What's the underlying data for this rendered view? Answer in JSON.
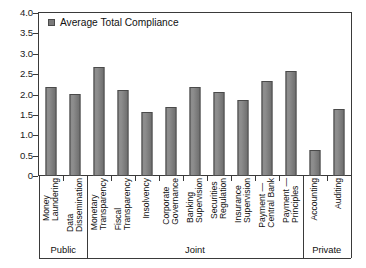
{
  "chart_data": {
    "type": "bar",
    "title": "",
    "xlabel": "",
    "ylabel": "",
    "ylim": [
      0,
      4.0
    ],
    "ytick_labels": [
      "4.0",
      "3.5",
      "3.0",
      "2.5",
      "2.0",
      "1.5",
      "1.0",
      "0.5",
      "0"
    ],
    "ytick_values": [
      4.0,
      3.5,
      3.0,
      2.5,
      2.0,
      1.5,
      1.0,
      0.5,
      0
    ],
    "grid": false,
    "legend_position": "top-left",
    "legend": [
      "Average Total Compliance"
    ],
    "series_name": "Average Total Compliance",
    "bar_color": "#7a7a7a",
    "bar_edge_color": "#4a4a4a",
    "categories": [
      "Money Laundering",
      "Data Dissemination",
      "Monetary Transparency",
      "Fiscal Transparency",
      "Insolvency",
      "Corporate Governance",
      "Banking Supervision",
      "Securities Regulation",
      "Insurance Supervision",
      "Payment — Central Bank",
      "Payment — Principles",
      "Accounting",
      "Auditing"
    ],
    "category_lines": [
      [
        "Money",
        "Laundering"
      ],
      [
        "Data",
        "Dissemination"
      ],
      [
        "Monetary",
        "Transparency"
      ],
      [
        "Fiscal",
        "Transparency"
      ],
      [
        "Insolvency",
        ""
      ],
      [
        "Corporate",
        "Governance"
      ],
      [
        "Banking",
        "Supervision"
      ],
      [
        "Securities",
        "Regulation"
      ],
      [
        "Insurance",
        "Supervision"
      ],
      [
        "Payment —",
        "Central Bank"
      ],
      [
        "Payment —",
        "Principles"
      ],
      [
        "Accounting",
        ""
      ],
      [
        "Auditing",
        ""
      ]
    ],
    "values": [
      2.18,
      2.02,
      2.67,
      2.12,
      1.57,
      1.7,
      2.18,
      2.05,
      1.87,
      2.32,
      2.58,
      0.65,
      1.65
    ],
    "groups": [
      {
        "label": "Public",
        "start": 0,
        "end": 1
      },
      {
        "label": "Joint",
        "start": 2,
        "end": 10
      },
      {
        "label": "Private",
        "start": 11,
        "end": 12
      }
    ]
  }
}
